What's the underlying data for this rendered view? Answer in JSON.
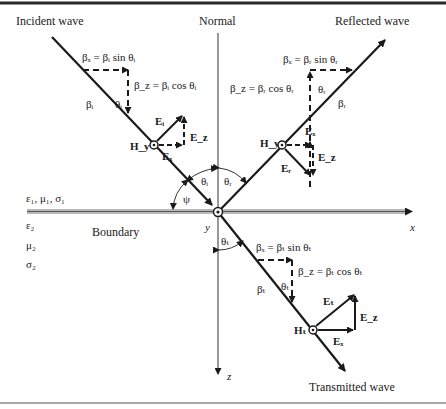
{
  "figure": {
    "frame": {
      "top_border_color": "#2a2a2a",
      "bottom_border_color": "#8a8a8a",
      "boundary_color": "#b8b8b8"
    },
    "labels": {
      "incident_wave": "Incident wave",
      "normal": "Normal",
      "reflected_wave": "Reflected wave",
      "transmitted_wave": "Transmitted wave",
      "boundary": "Boundary",
      "x_axis": "x",
      "y_axis": "y",
      "z_axis": "z",
      "medium1": "ε₁, μ₁, σ₁",
      "medium2_eps": "ε₂",
      "medium2_mu": "μ₂",
      "medium2_sigma": "σ₂",
      "psi": "ψ",
      "theta_i": "θᵢ",
      "theta_r": "θᵣ",
      "theta_t": "θₜ"
    },
    "incident": {
      "beta_x_eq": "βₓ = βᵢ sin θᵢ",
      "beta_z_eq": "β_z = βᵢ cos θᵢ",
      "beta": "βᵢ",
      "theta": "θᵢ",
      "E": "Eᵢ",
      "Ex": "Eₓ",
      "Ez": "E_z",
      "H": "H_y"
    },
    "reflected": {
      "beta_x_eq": "βₓ = βᵣ sin θᵣ",
      "beta_z_eq": "β_z = βᵣ cos θᵣ",
      "beta": "βᵣ",
      "theta": "θᵣ",
      "E": "Eᵣ",
      "Ex": "Eₓ",
      "Ez": "E_z",
      "H": "H_y"
    },
    "transmitted": {
      "beta_x_eq": "βₓ = βₜ sin θₜ",
      "beta_z_eq": "β_z = βₜ cos θₜ",
      "beta": "βₜ",
      "theta": "θₜ",
      "E": "Eₜ",
      "Ex": "Eₓ",
      "Ez": "E_z",
      "H": "Hₜ"
    }
  }
}
